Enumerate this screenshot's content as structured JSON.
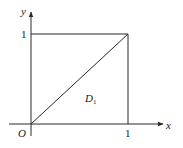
{
  "diagram": {
    "type": "region-plot",
    "axes": {
      "x_label": "x",
      "y_label": "y",
      "origin_label": "O",
      "x_tick": "1",
      "y_tick": "1"
    },
    "region": {
      "label": "D",
      "subscript": "1",
      "description": "Triangle bounded by y = x, x = 1, and y = 0 within the unit square"
    },
    "shapes": [
      {
        "kind": "square",
        "from": [
          0,
          0
        ],
        "to": [
          1,
          1
        ]
      },
      {
        "kind": "diagonal",
        "from": [
          0,
          0
        ],
        "to": [
          1,
          1
        ]
      }
    ],
    "colors": {
      "line": "#2a2a2a",
      "background": "#ffffff"
    }
  }
}
